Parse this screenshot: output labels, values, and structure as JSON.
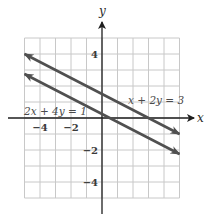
{
  "chart_data": {
    "type": "line",
    "title": "",
    "xlabel": "x",
    "ylabel": "y",
    "xlim": [
      -5,
      5
    ],
    "ylim": [
      -5,
      5
    ],
    "grid": true,
    "x_tick_labels": [
      {
        "value": -4,
        "label": "−4"
      },
      {
        "value": -2,
        "label": "−2"
      }
    ],
    "y_tick_labels": [
      {
        "value": 4,
        "label": "4"
      },
      {
        "value": -2,
        "label": "−2"
      },
      {
        "value": -4,
        "label": "−4"
      }
    ],
    "series": [
      {
        "name": "x + 2y = 3",
        "equation": "x + 2y = 3",
        "x": [
          -5,
          5
        ],
        "y": [
          4,
          -1
        ],
        "color": "#505050",
        "label_position": {
          "x": 1.5,
          "y": 1.6
        }
      },
      {
        "name": "2x + 4y = 1",
        "equation": "2x + 4y = 1",
        "x": [
          -5,
          5
        ],
        "y": [
          2.75,
          -2.25
        ],
        "color": "#505050",
        "label_position": {
          "x": -5.1,
          "y": 0.3
        }
      }
    ],
    "legend": "inline labels"
  },
  "labels": {
    "x_axis": "x",
    "y_axis": "y",
    "line1": "x + 2y = 3",
    "line2": "2x + 4y = 1"
  },
  "colors": {
    "grid": "#c8c8c8",
    "axis": "#1e1e1e",
    "line": "#505050"
  }
}
